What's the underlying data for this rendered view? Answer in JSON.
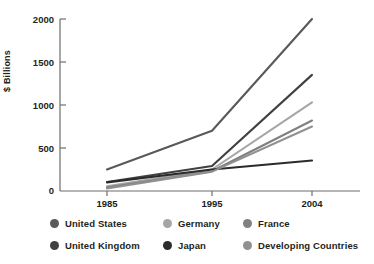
{
  "chart_data": {
    "type": "line",
    "title": "",
    "xlabel": "",
    "ylabel": "$ Billions",
    "categories": [
      "1985",
      "1995",
      "2004"
    ],
    "x_tick_labels": [
      "1985",
      "1995",
      "2004"
    ],
    "y_tick_labels": [
      "0",
      "500",
      "1000",
      "1500",
      "2000"
    ],
    "y_ticks": [
      0,
      500,
      1000,
      1500,
      2000
    ],
    "ylim": [
      0,
      2000
    ],
    "grid": false,
    "legend_position": "bottom",
    "series": [
      {
        "name": "United States",
        "color": "#595959",
        "values": [
          250,
          700,
          2000
        ]
      },
      {
        "name": "Germany",
        "color": "#a6a6a6",
        "values": [
          55,
          250,
          1030
        ]
      },
      {
        "name": "France",
        "color": "#808080",
        "values": [
          40,
          230,
          820
        ]
      },
      {
        "name": "United Kingdom",
        "color": "#404040",
        "values": [
          105,
          290,
          1350
        ]
      },
      {
        "name": "Japan",
        "color": "#2b2b2b",
        "values": [
          100,
          250,
          355
        ]
      },
      {
        "name": "Developing Countries",
        "color": "#909090",
        "values": [
          30,
          225,
          750
        ]
      }
    ]
  },
  "legend": {
    "items": [
      {
        "label": "United States",
        "color": "#595959"
      },
      {
        "label": "Germany",
        "color": "#a6a6a6"
      },
      {
        "label": "France",
        "color": "#808080"
      },
      {
        "label": "United Kingdom",
        "color": "#404040"
      },
      {
        "label": "Japan",
        "color": "#2b2b2b"
      },
      {
        "label": "Developing Countries",
        "color": "#909090"
      }
    ]
  },
  "axis": {
    "y_label": "$ Billions",
    "y_tick_0": "0",
    "y_tick_1": "500",
    "y_tick_2": "1000",
    "y_tick_3": "1500",
    "y_tick_4": "2000",
    "x_tick_0": "1985",
    "x_tick_1": "1995",
    "x_tick_2": "2004"
  },
  "colors": {
    "axis": "#6d6d6d",
    "text": "#231f20",
    "background": "#ffffff"
  }
}
